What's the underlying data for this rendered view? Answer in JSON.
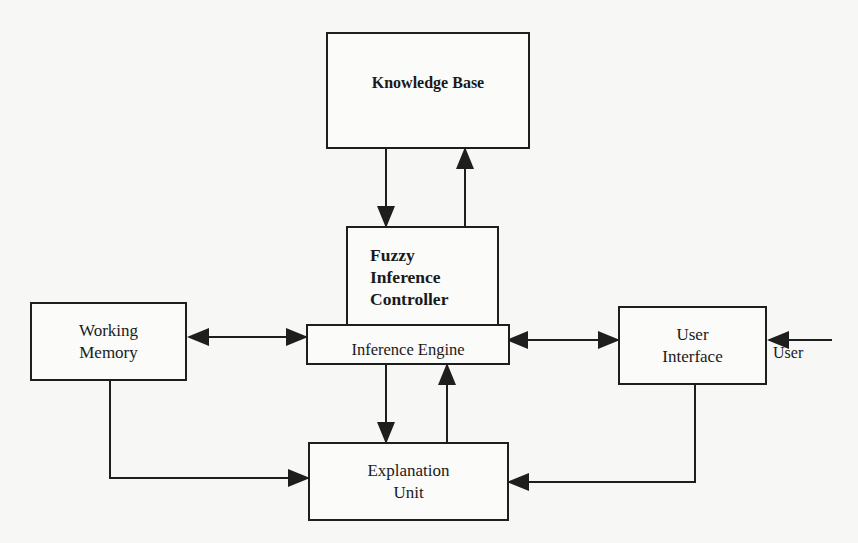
{
  "diagram": {
    "type": "block-diagram",
    "nodes": {
      "knowledge_base": {
        "label": "Knowledge Base"
      },
      "fuzzy_inference_controller": {
        "line1": "Fuzzy",
        "line2": "Inference",
        "line3": "Controller"
      },
      "inference_engine": {
        "label": "Inference Engine"
      },
      "working_memory": {
        "line1": "Working",
        "line2": "Memory"
      },
      "user_interface": {
        "line1": "User",
        "line2": "Interface"
      },
      "explanation_unit": {
        "line1": "Explanation",
        "line2": "Unit"
      }
    },
    "external": {
      "user_label": "User"
    },
    "edges": [
      {
        "from": "Knowledge Base",
        "to": "Fuzzy Inference Controller",
        "direction": "one-way"
      },
      {
        "from": "Fuzzy Inference Controller",
        "to": "Knowledge Base",
        "direction": "one-way"
      },
      {
        "from": "Working Memory",
        "to": "Inference Engine",
        "direction": "bidirectional"
      },
      {
        "from": "Inference Engine",
        "to": "User Interface",
        "direction": "bidirectional"
      },
      {
        "from": "User",
        "to": "User Interface",
        "direction": "one-way"
      },
      {
        "from": "Inference Engine",
        "to": "Explanation Unit",
        "direction": "one-way"
      },
      {
        "from": "Explanation Unit",
        "to": "Inference Engine",
        "direction": "one-way"
      },
      {
        "from": "Working Memory",
        "to": "Explanation Unit",
        "direction": "one-way"
      },
      {
        "from": "User Interface",
        "to": "Explanation Unit",
        "direction": "one-way"
      }
    ],
    "colors": {
      "ink": "#1e1e1e",
      "paper": "#f7f7f5"
    }
  }
}
